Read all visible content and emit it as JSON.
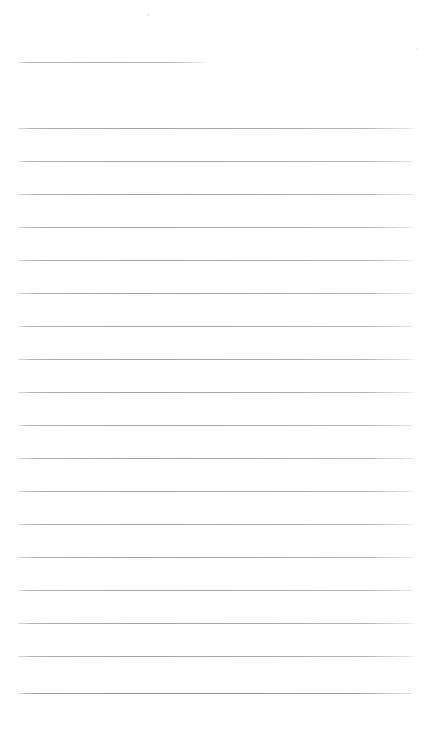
{
  "document": {
    "kind": "scanned-blank-lined-page",
    "title": "Blank Lined Page",
    "page_width": 429,
    "page_height": 739,
    "background_color": "#ffffff",
    "rule_color": "#a8a8af",
    "content_text": "",
    "notes_area_label": "Blank ruled writing area"
  },
  "layout": {
    "margin_left": 18,
    "margin_right": 413,
    "full_rule_width": 395,
    "short_rule_width": 187,
    "line_spacing": 32.9,
    "first_rule_y": 62,
    "last_rule_y": 693
  },
  "rules": [
    {
      "id": "rule-1",
      "y": 62,
      "x": 18,
      "width": 187,
      "variant": "short"
    },
    {
      "id": "rule-2",
      "y": 128,
      "x": 18,
      "width": 395,
      "variant": "full"
    },
    {
      "id": "rule-3",
      "y": 161,
      "x": 18,
      "width": 395,
      "variant": "full"
    },
    {
      "id": "rule-4",
      "y": 194,
      "x": 18,
      "width": 395,
      "variant": "full"
    },
    {
      "id": "rule-5",
      "y": 227,
      "x": 18,
      "width": 395,
      "variant": "full"
    },
    {
      "id": "rule-6",
      "y": 260,
      "x": 18,
      "width": 395,
      "variant": "full"
    },
    {
      "id": "rule-7",
      "y": 293,
      "x": 18,
      "width": 395,
      "variant": "full"
    },
    {
      "id": "rule-8",
      "y": 326,
      "x": 18,
      "width": 395,
      "variant": "full"
    },
    {
      "id": "rule-9",
      "y": 359,
      "x": 18,
      "width": 395,
      "variant": "full"
    },
    {
      "id": "rule-10",
      "y": 392,
      "x": 18,
      "width": 395,
      "variant": "full"
    },
    {
      "id": "rule-11",
      "y": 425,
      "x": 18,
      "width": 395,
      "variant": "full"
    },
    {
      "id": "rule-12",
      "y": 458,
      "x": 18,
      "width": 395,
      "variant": "full"
    },
    {
      "id": "rule-13",
      "y": 491,
      "x": 18,
      "width": 395,
      "variant": "full"
    },
    {
      "id": "rule-14",
      "y": 524,
      "x": 18,
      "width": 395,
      "variant": "full"
    },
    {
      "id": "rule-15",
      "y": 557,
      "x": 18,
      "width": 395,
      "variant": "full"
    },
    {
      "id": "rule-16",
      "y": 590,
      "x": 18,
      "width": 395,
      "variant": "full"
    },
    {
      "id": "rule-17",
      "y": 623,
      "x": 18,
      "width": 395,
      "variant": "full"
    },
    {
      "id": "rule-18",
      "y": 656,
      "x": 18,
      "width": 395,
      "variant": "full"
    },
    {
      "id": "rule-19",
      "y": 693,
      "x": 18,
      "width": 395,
      "variant": "last"
    }
  ],
  "specks": [
    {
      "id": "speck-1",
      "x": 147,
      "y": 13,
      "size": 3
    },
    {
      "id": "speck-2",
      "x": 416,
      "y": 48,
      "size": 2
    }
  ]
}
